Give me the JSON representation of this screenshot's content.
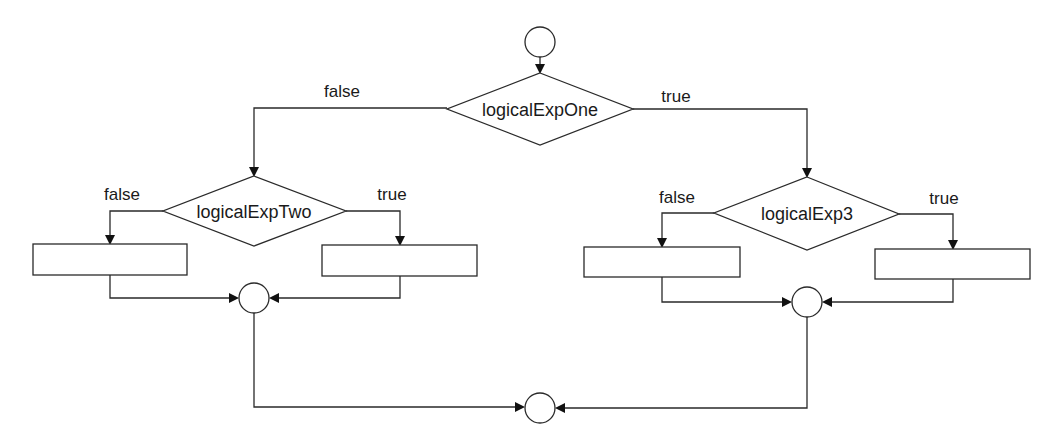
{
  "diagram": {
    "type": "flowchart",
    "colors": {
      "line": "#2a2a2a",
      "text": "#1a1a1a",
      "background": "#ffffff"
    },
    "start_node": {
      "shape": "circle"
    },
    "decisions": [
      {
        "id": "d1",
        "label": "logicalExpOne",
        "false_label": "false",
        "true_label": "true"
      },
      {
        "id": "d2",
        "label": "logicalExpTwo",
        "false_label": "false",
        "true_label": "true"
      },
      {
        "id": "d3",
        "label": "logicalExp3",
        "false_label": "false",
        "true_label": "true"
      }
    ],
    "process_boxes": [
      {
        "id": "b1",
        "label": ""
      },
      {
        "id": "b2",
        "label": ""
      },
      {
        "id": "b3",
        "label": ""
      },
      {
        "id": "b4",
        "label": ""
      }
    ],
    "junctions": [
      {
        "id": "j-left",
        "shape": "circle"
      },
      {
        "id": "j-right",
        "shape": "circle"
      },
      {
        "id": "j-end",
        "shape": "circle"
      }
    ]
  }
}
